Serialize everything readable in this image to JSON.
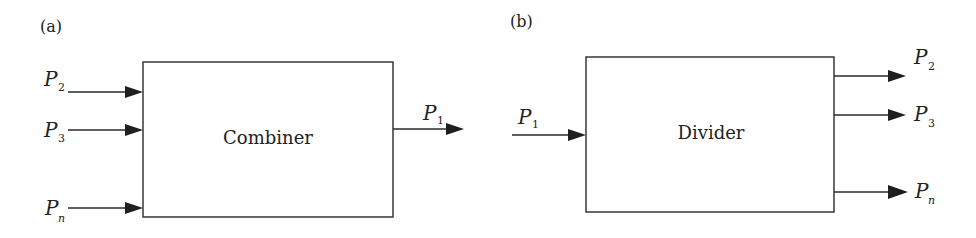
{
  "diagram": {
    "panels": [
      {
        "id": "a",
        "label": "(a)",
        "block": "Combiner",
        "inputs": [
          {
            "symbol": "P",
            "subscript": "2"
          },
          {
            "symbol": "P",
            "subscript": "3"
          },
          {
            "symbol": "P",
            "subscript": "n"
          }
        ],
        "outputs": [
          {
            "symbol": "P",
            "subscript": "1"
          }
        ]
      },
      {
        "id": "b",
        "label": "(b)",
        "block": "Divider",
        "inputs": [
          {
            "symbol": "P",
            "subscript": "1"
          }
        ],
        "outputs": [
          {
            "symbol": "P",
            "subscript": "2"
          },
          {
            "symbol": "P",
            "subscript": "3"
          },
          {
            "symbol": "P",
            "subscript": "n"
          }
        ]
      }
    ],
    "colors": {
      "stroke": "#2a2a2a",
      "background": "#ffffff"
    }
  }
}
